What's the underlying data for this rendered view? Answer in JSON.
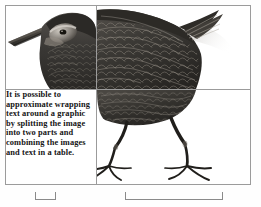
{
  "document": {
    "background_color": "#fefefe",
    "table": {
      "border_color": "#9b9b9b",
      "rows": 2,
      "columns": 2,
      "caption": "Table used to approximate text wrapping around a graphic"
    }
  },
  "cells": {
    "top_left": {
      "content_type": "image",
      "image_name": "bird-illustration-top-left",
      "alt": "Upper-left portion of a water rail illustration showing the long beak and head"
    },
    "top_right": {
      "content_type": "image",
      "image_name": "bird-illustration-top-right",
      "alt": "Upper-right portion of a water rail illustration showing the back, wing and tail"
    },
    "bottom_left": {
      "content_type": "text",
      "text": "It is possible to approximate wrapping text around a graphic by splitting the image into two parts and combining the images and text in a table.",
      "lines": [
        "It is possible to",
        "approximate",
        "wrapping text around",
        "a graphic by splitting",
        "the image into two",
        "parts and combining",
        "the images and text in",
        "a table."
      ],
      "text_color": "#151515"
    },
    "bottom_right": {
      "content_type": "image",
      "image_name": "bird-illustration-bottom-right",
      "alt": "Lower-right portion of a water rail illustration showing the belly, legs and feet"
    }
  },
  "artwork": {
    "subject": "water-rail-bird",
    "style": "grayscale engraving",
    "body_color": "#3c3a37",
    "body_color_light": "#6f6b66",
    "highlight_color": "#b8b3ac",
    "shadow_color": "#d9d7d4"
  },
  "column_markers": {
    "label": "column width markers",
    "marker_color": "#8a8a8a",
    "markers": [
      {
        "name": "column-1-width-marker",
        "left": 35,
        "width": 19
      },
      {
        "name": "column-2-width-marker",
        "left": 125,
        "width": 96
      }
    ]
  }
}
